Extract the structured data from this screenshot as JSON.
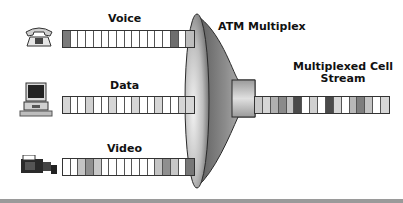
{
  "diagram": {
    "title": "ATM Multiplex",
    "output_label_line1": "Multiplexed Cell",
    "output_label_line2": "Stream",
    "inputs": [
      {
        "label": "Voice",
        "icon": "telephone-icon",
        "cells": [
          "#7a7a7a",
          "#ffffff",
          "#ffffff",
          "#ffffff",
          "#ffffff",
          "#ffffff",
          "#ffffff",
          "#ffffff",
          "#ffffff",
          "#ffffff",
          "#ffffff",
          "#ffffff",
          "#ffffff",
          "#ffffff",
          "#6e6e6e",
          "#ffffff",
          "#bdbdbd"
        ]
      },
      {
        "label": "Data",
        "icon": "computer-icon",
        "cells": [
          "#d6d6d6",
          "#ffffff",
          "#ffffff",
          "#d0d0d0",
          "#ffffff",
          "#ffffff",
          "#d6d6d6",
          "#ffffff",
          "#ffffff",
          "#d6d6d6",
          "#ffffff",
          "#ffffff",
          "#d6d6d6",
          "#ffffff",
          "#ffffff",
          "#d6d6d6",
          "#d6d6d6"
        ]
      },
      {
        "label": "Video",
        "icon": "video-camera-icon",
        "cells": [
          "#ffffff",
          "#ffffff",
          "#c4c4c4",
          "#8f8f8f",
          "#c8c8c8",
          "#ffffff",
          "#ffffff",
          "#ffffff",
          "#ffffff",
          "#ffffff",
          "#ffffff",
          "#ffffff",
          "#c4c4c4",
          "#8f8f8f",
          "#c8c8c8",
          "#ffffff",
          "#777777"
        ]
      }
    ],
    "output_cells": [
      "#c8c8c8",
      "#d6d6d6",
      "#b0b0b0",
      "#8a8a8a",
      "#c4c4c4",
      "#4a4a4a",
      "#ffffff",
      "#d0d0d0",
      "#ffffff",
      "#4a4a4a",
      "#d6d6d6",
      "#ffffff",
      "#b8b8b8",
      "#7e7e7e",
      "#c4c4c4",
      "#ffffff",
      "#d6d6d6"
    ],
    "colors": {
      "funnel_dark": "#3c3c3c",
      "funnel_mid": "#8c8c8c",
      "funnel_light": "#e6e6e6",
      "rule": "#9a9a9a"
    }
  }
}
